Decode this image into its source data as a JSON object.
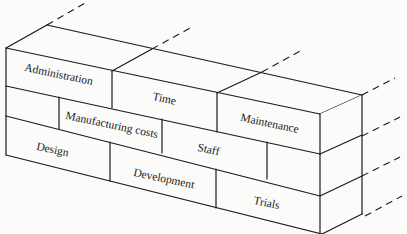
{
  "diagram": {
    "type": "brick-wall",
    "rows": [
      {
        "row": "top",
        "bricks": [
          "Administration",
          "Time",
          "Maintenance"
        ]
      },
      {
        "row": "middle",
        "bricks": [
          "",
          "Manufacturing costs",
          "Staff",
          ""
        ]
      },
      {
        "row": "bottom",
        "bricks": [
          "Design",
          "Development",
          "Trials"
        ]
      }
    ],
    "labels": {
      "administration": "Administration",
      "time": "Time",
      "maintenance": "Maintenance",
      "manufacturing_costs": "Manufacturing costs",
      "staff": "Staff",
      "design": "Design",
      "development": "Development",
      "trials": "Trials"
    },
    "continuation": "dashed lines extend to the back-right indicating the wall continues",
    "colors": {
      "line": "#1a1a1a",
      "background": "#fbfbfa"
    }
  }
}
